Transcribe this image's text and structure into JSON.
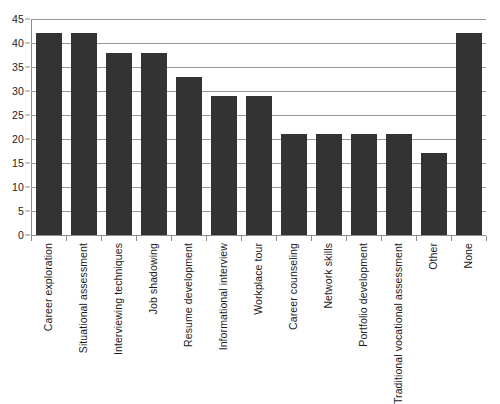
{
  "chart_data": {
    "type": "bar",
    "title": "",
    "subtitle": "",
    "xlabel": "",
    "ylabel": "",
    "ylim": [
      0,
      45
    ],
    "y_ticks": [
      0,
      5,
      10,
      15,
      20,
      25,
      30,
      35,
      40,
      45
    ],
    "grid": true,
    "legend": false,
    "legend_position": "none",
    "bar_color": "#333333",
    "gridline_color": "#9a9a9a",
    "axis_color": "#8c8c8c",
    "categories": [
      "Career exploration",
      "Situational assessment",
      "Interviewing techniques",
      "Job shadowing",
      "Resume development",
      "Informational interview",
      "Workplace tour",
      "Career counseling",
      "Network skills",
      "Portfolio development",
      "Traditional vocational assessment",
      "Other",
      "None"
    ],
    "values": [
      42,
      42,
      38,
      38,
      33,
      29,
      29,
      21,
      21,
      21,
      21,
      17,
      42
    ]
  }
}
